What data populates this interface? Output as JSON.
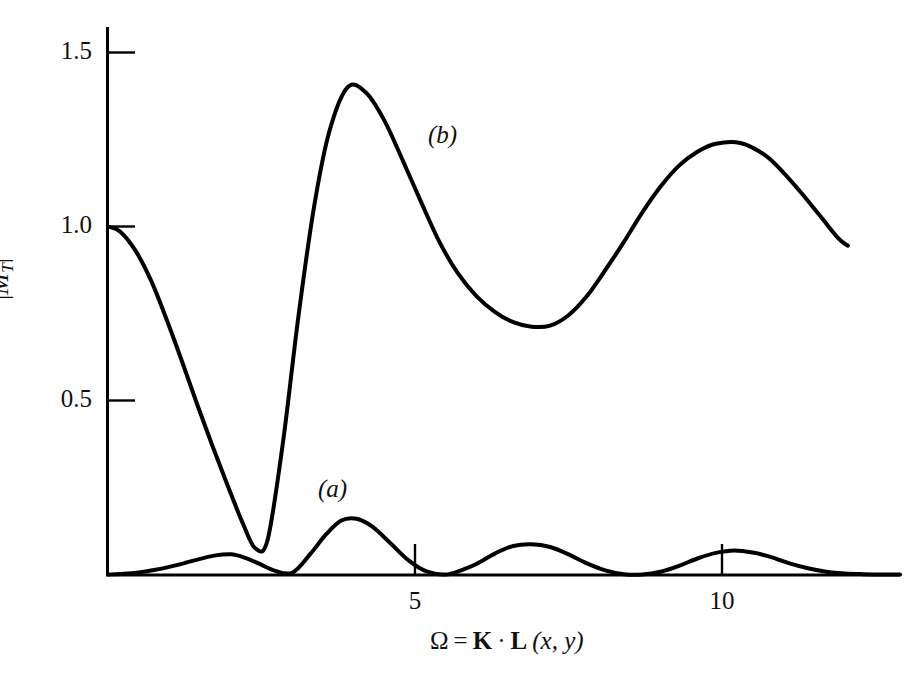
{
  "figure": {
    "background_color": "#ffffff",
    "ink_color": "#000000",
    "width": 921,
    "height": 674
  },
  "axes": {
    "y_title_parts": {
      "open_bar": "|",
      "m": "M",
      "subscript": "T",
      "close_bar": "|",
      "superscript": "2"
    },
    "x_title_parts": {
      "omega": "Ω",
      "equals": "=",
      "k": "K",
      "dot": "·",
      "l": "L",
      "args": "(x, y)"
    },
    "y_ticks": [
      "1.5",
      "1.0",
      "0.5"
    ],
    "x_ticks": [
      "5",
      "10"
    ]
  },
  "annotations": {
    "curve_a_tag": "(a)",
    "curve_b_tag": "(b)"
  },
  "chart_data": {
    "type": "line",
    "title": "",
    "xlabel": "Ω = K · L (x, y)",
    "ylabel": "|M_T|^2",
    "xlim": [
      0,
      12.9
    ],
    "ylim": [
      0,
      1.65
    ],
    "x_ticks": [
      5,
      10
    ],
    "y_ticks": [
      0.5,
      1.0,
      1.5
    ],
    "grid": false,
    "legend": "inline annotations (a) and (b)",
    "series": [
      {
        "name": "(a)",
        "description": "low-amplitude oscillating lobes starting at zero, sinc-squared-like envelope decaying slowly",
        "x": [
          0.0,
          0.25,
          0.5,
          0.75,
          1.0,
          1.25,
          1.5,
          1.75,
          2.0,
          2.2,
          2.45,
          2.7,
          3.0,
          3.3,
          3.55,
          3.8,
          4.05,
          4.3,
          4.6,
          4.9,
          5.2,
          5.5,
          5.75,
          6.0,
          6.3,
          6.6,
          6.9,
          7.2,
          7.5,
          7.8,
          8.1,
          8.4,
          8.7,
          9.0,
          9.3,
          9.6,
          9.9,
          10.2,
          10.5,
          10.8,
          11.1,
          11.4,
          11.7,
          12.0,
          12.3,
          12.6,
          12.9
        ],
        "y": [
          0.0,
          0.002,
          0.006,
          0.013,
          0.022,
          0.033,
          0.045,
          0.055,
          0.058,
          0.05,
          0.032,
          0.012,
          0.005,
          0.06,
          0.115,
          0.155,
          0.16,
          0.138,
          0.09,
          0.04,
          0.008,
          0.0,
          0.012,
          0.03,
          0.06,
          0.082,
          0.087,
          0.079,
          0.058,
          0.032,
          0.012,
          0.001,
          0.0,
          0.008,
          0.025,
          0.046,
          0.062,
          0.069,
          0.063,
          0.05,
          0.032,
          0.018,
          0.008,
          0.003,
          0.001,
          0.0,
          0.0
        ]
      },
      {
        "name": "(b)",
        "description": "starts at unity, falls to zero near Ω=2.4, rises to main maximum 1.40 near Ω=3.9, minimum 0.71 near Ω=7.0, second maximum 1.24 near Ω=10.3, descending to 0.95 at the right edge",
        "x": [
          0.0,
          0.2,
          0.45,
          0.7,
          0.95,
          1.2,
          1.45,
          1.7,
          1.95,
          2.2,
          2.4,
          2.6,
          2.85,
          3.1,
          3.35,
          3.6,
          3.9,
          4.2,
          4.5,
          4.8,
          5.1,
          5.4,
          5.7,
          6.0,
          6.3,
          6.6,
          6.9,
          7.2,
          7.5,
          7.8,
          8.1,
          8.4,
          8.7,
          9.0,
          9.3,
          9.6,
          9.9,
          10.3,
          10.7,
          11.0,
          11.3,
          11.6,
          11.9,
          12.05
        ],
        "y": [
          1.0,
          0.985,
          0.93,
          0.845,
          0.735,
          0.615,
          0.49,
          0.37,
          0.255,
          0.145,
          0.075,
          0.1,
          0.38,
          0.74,
          1.05,
          1.27,
          1.4,
          1.385,
          1.305,
          1.19,
          1.07,
          0.955,
          0.865,
          0.8,
          0.755,
          0.725,
          0.712,
          0.715,
          0.745,
          0.8,
          0.875,
          0.955,
          1.04,
          1.115,
          1.175,
          1.215,
          1.238,
          1.24,
          1.205,
          1.155,
          1.095,
          1.03,
          0.965,
          0.945
        ]
      }
    ]
  }
}
